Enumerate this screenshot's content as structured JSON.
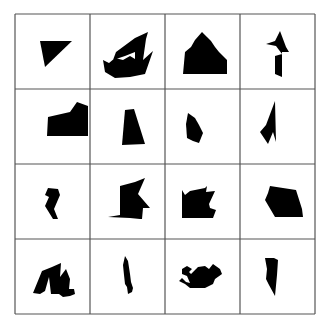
{
  "figure": {
    "rows": 4,
    "cols": 4,
    "origin_x": 15,
    "origin_y": 14,
    "cell_size": 75,
    "line_color": "#555555",
    "shape_color": "#000000",
    "background": "#ffffff"
  },
  "cells": [
    {
      "row": 0,
      "col": 0,
      "name": "triangle",
      "points": "25,27 57,27 30,53"
    },
    {
      "row": 0,
      "col": 1,
      "name": "boat-zigzag",
      "points": "58,18 56,25 53,46 63,37 55,60 40,63 25,64 15,58 13,46 19,49 25,44 33,46 40,42 45,45 45,38 35,42 23,46 26,38 45,24"
    },
    {
      "row": 0,
      "col": 2,
      "name": "house-pentagon",
      "points": "37,18 42,23 46,27 50,33 54,38 62,46 62,60 18,60 20,38 26,33 30,26"
    },
    {
      "row": 0,
      "col": 3,
      "name": "arrow-bird",
      "points": "40,17 46,33 49,38 42,38 42,63 35,60 35,42 42,40 36,32 26,30 35,27"
    },
    {
      "row": 1,
      "col": 0,
      "name": "boot-block",
      "points": "62,13 73,17 73,47 32,47 33,28 55,23"
    },
    {
      "row": 1,
      "col": 1,
      "name": "trapezoid",
      "points": "35,21 44,20 55,55 32,56"
    },
    {
      "row": 1,
      "col": 2,
      "name": "hexagon-leaf",
      "points": "23,24 30,29 34,36 38,44 34,54 28,52 22,49 21,35"
    },
    {
      "row": 1,
      "col": 3,
      "name": "spike-hook",
      "points": "35,12 36,53 33,43 28,55 20,43 26,36"
    },
    {
      "row": 2,
      "col": 0,
      "name": "small-chevron",
      "points": "33,24 43,25 45,31 39,45 43,55 38,55 30,42 34,33 30,31"
    },
    {
      "row": 2,
      "col": 1,
      "name": "flag-wedge",
      "points": "18,53 30,51 30,22 45,18 55,14 48,30 60,44 53,44 52,55 50,55 40,54"
    },
    {
      "row": 2,
      "col": 2,
      "name": "castle-block",
      "points": "17,26 20,31 25,27 40,24 42,22 41,28 50,27 44,40 45,44 51,46 48,54 17,54"
    },
    {
      "row": 2,
      "col": 3,
      "name": "quad-gem",
      "points": "30,22 56,26 62,45 63,53 35,53 25,36 28,29"
    },
    {
      "row": 3,
      "col": 0,
      "name": "zigzag-wave",
      "points": "27,32 37,28 46,24 45,38 51,30 55,40 54,50 59,50 60,55 55,57 48,58 44,55 36,55 34,38 30,52 25,55 18,54"
    },
    {
      "row": 3,
      "col": 1,
      "name": "thin-feather",
      "points": "35,17 38,22 40,35 41,43 43,49 42,53 38,55 37,48 35,45 34,36 33,26"
    },
    {
      "row": 3,
      "col": 2,
      "name": "teapot",
      "points": "17,30 22,27 27,30 24,33 26,35 33,28 40,27 44,30 48,25 55,30 57,35 50,40 48,45 40,49 25,49 20,45 14,42 17,39 21,43 25,44 22,37 17,35"
    },
    {
      "row": 3,
      "col": 3,
      "name": "blade-wedge",
      "points": "25,19 34,19 38,21 37,36 35,57 29,46 26,40 27,30"
    }
  ]
}
